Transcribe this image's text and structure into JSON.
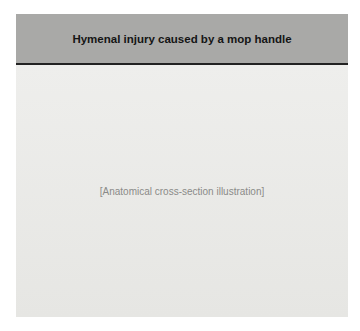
{
  "figure": {
    "title": "Hymenal injury caused by a mop handle",
    "header_color": "#a9a9a7",
    "illustration_placeholder": "[Anatomical cross-section illustration]"
  }
}
